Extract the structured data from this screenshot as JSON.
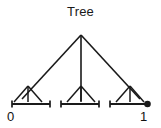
{
  "figure": {
    "title": "Tree",
    "type": "tree-diagram",
    "background_color": "#ffffff",
    "stroke_color": "#1a1a1a"
  },
  "axis": {
    "start_label": "0",
    "end_label": "1"
  },
  "diagram_data": {
    "type": "tree",
    "description": "Ternary tree over the unit interval",
    "root": {
      "x": 81,
      "y": 35
    },
    "branching_factor": 3,
    "depth": 2,
    "nodes": [
      {
        "id": "root",
        "x": 81,
        "y": 35,
        "level": 0
      },
      {
        "id": "n0",
        "x": 28,
        "y": 88,
        "level": 1
      },
      {
        "id": "n1",
        "x": 81,
        "y": 88,
        "level": 1
      },
      {
        "id": "n2",
        "x": 130,
        "y": 88,
        "level": 1
      }
    ],
    "edges": [
      {
        "from": "root",
        "to": "n0"
      },
      {
        "from": "root",
        "to": "n1"
      },
      {
        "from": "root",
        "to": "n2"
      }
    ],
    "leaf_fans": [
      {
        "parent": "n0",
        "targets_x": [
          14,
          28,
          42
        ],
        "y": 104
      },
      {
        "parent": "n1",
        "targets_x": [
          67,
          81,
          95
        ],
        "y": 104
      },
      {
        "parent": "n2",
        "targets_x": [
          116,
          130,
          144
        ],
        "y": 104
      }
    ],
    "intervals": [
      {
        "x1": 12,
        "x2": 50,
        "y": 104,
        "left_cap": "serif",
        "right_cap": "serif"
      },
      {
        "x1": 61,
        "x2": 99,
        "y": 104,
        "left_cap": "serif",
        "right_cap": "serif"
      },
      {
        "x1": 110,
        "x2": 148,
        "y": 104,
        "left_cap": "serif",
        "right_cap": "dot"
      }
    ],
    "endpoint_dot": {
      "x": 148,
      "y": 104,
      "r": 3.2,
      "filled": true
    }
  }
}
